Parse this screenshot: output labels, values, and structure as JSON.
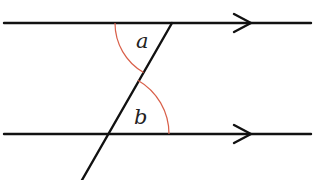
{
  "diagram": {
    "colors": {
      "line": "#111111",
      "arc": "#d9604a",
      "label": "#222222"
    },
    "labels": {
      "angle_a": "a",
      "angle_b": "b"
    },
    "elements": {
      "upper_parallel_line": {
        "x1": 4,
        "y1": 23,
        "x2": 311,
        "y2": 23,
        "arrow_at_x": 250
      },
      "lower_parallel_line": {
        "x1": 4,
        "y1": 134,
        "x2": 311,
        "y2": 134,
        "arrow_at_x": 250
      },
      "transversal": {
        "x1": 172,
        "y1": 23,
        "x2": 82,
        "y2": 180
      },
      "angle_a_arc": {
        "center": [
          172,
          23
        ],
        "radius": 57
      },
      "angle_b_arc": {
        "center": [
          107,
          134
        ],
        "radius": 62
      }
    }
  }
}
